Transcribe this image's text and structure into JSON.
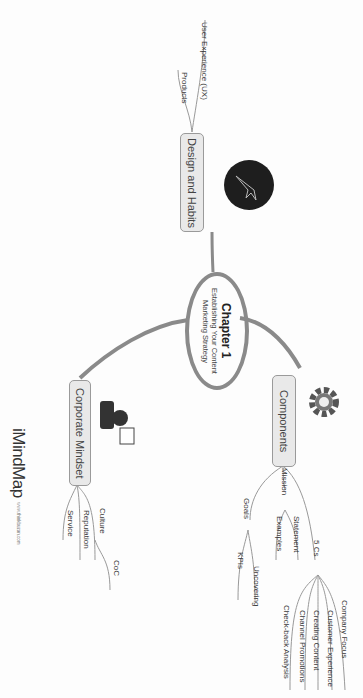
{
  "central": {
    "title": "Chapter 1",
    "subtitle_line1": "Establishing Your Content",
    "subtitle_line2": "Marketing Strategy"
  },
  "branches": {
    "design": {
      "label": "Design and Habits",
      "children": [
        "User Experience (UX)",
        "Products"
      ]
    },
    "components": {
      "label": "Components",
      "children": {
        "mission": {
          "label": "Mission",
          "children": [
            "Statement",
            "Examples"
          ]
        },
        "goals": {
          "label": "Goals",
          "children": [
            "KPIs",
            "Uncovering"
          ]
        },
        "five_cs": {
          "label": "5 Cs",
          "children": [
            "Company Focus",
            "Customer Experience",
            "Creating Content",
            "Channel Promotions",
            "Check-back Analysis"
          ]
        }
      }
    },
    "corporate": {
      "label": "Corporate Mindset",
      "children": [
        "Culture",
        "Reputation",
        "Service"
      ],
      "culture_child": "CoC"
    }
  },
  "icons": {
    "design": "rocket-icon",
    "components": "gear-icon",
    "corporate": "businessman-icon"
  },
  "logo": {
    "brand": "iMindMap",
    "url": "www.thinkbuzan.com"
  },
  "colors": {
    "branch": "#8a8a8a",
    "node_fill": "#e9e9e9",
    "node_border": "#9a9a9a"
  }
}
